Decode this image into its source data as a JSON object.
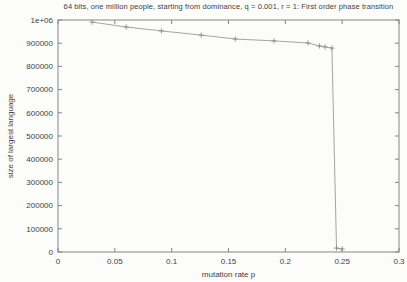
{
  "figure": {
    "title": "64 bits, one million people, starting from dominance, q = 0.001, r = 1: First order phase transition"
  },
  "chart_data": {
    "type": "line",
    "title": "64 bits, one million people, starting from dominance, q = 0.001, r = 1: First order phase transition",
    "xlabel": "mutation rate p",
    "ylabel": "size of largest language",
    "xlim": [
      0,
      0.3
    ],
    "ylim": [
      0,
      1000000
    ],
    "grid": false,
    "legend": "none",
    "marker": "plus",
    "x_ticks": {
      "values": [
        0,
        0.05,
        0.1,
        0.15,
        0.2,
        0.25,
        0.3
      ],
      "labels": [
        "0",
        "0.05",
        "0.1",
        "0.15",
        "0.2",
        "0.25",
        "0.3"
      ]
    },
    "y_ticks": {
      "values": [
        0,
        100000,
        200000,
        300000,
        400000,
        500000,
        600000,
        700000,
        800000,
        900000,
        1000000
      ],
      "labels": [
        "0",
        "100000",
        "200000",
        "300000",
        "400000",
        "500000",
        "600000",
        "700000",
        "800000",
        "900000",
        "1e+06"
      ]
    },
    "series": [
      {
        "name": "size of largest language",
        "x": [
          0.03,
          0.06,
          0.091,
          0.126,
          0.156,
          0.19,
          0.22,
          0.23,
          0.235,
          0.241,
          0.245,
          0.25
        ],
        "y": [
          991000,
          970000,
          953000,
          935000,
          918000,
          910000,
          901000,
          888000,
          884000,
          879000,
          17000,
          13000
        ]
      }
    ],
    "colors": {
      "line": "#9a9a9a",
      "marker": "#8c8c8c",
      "axis": "#858585",
      "text": "#3f3f3f",
      "background": "#fcfcfb"
    }
  }
}
